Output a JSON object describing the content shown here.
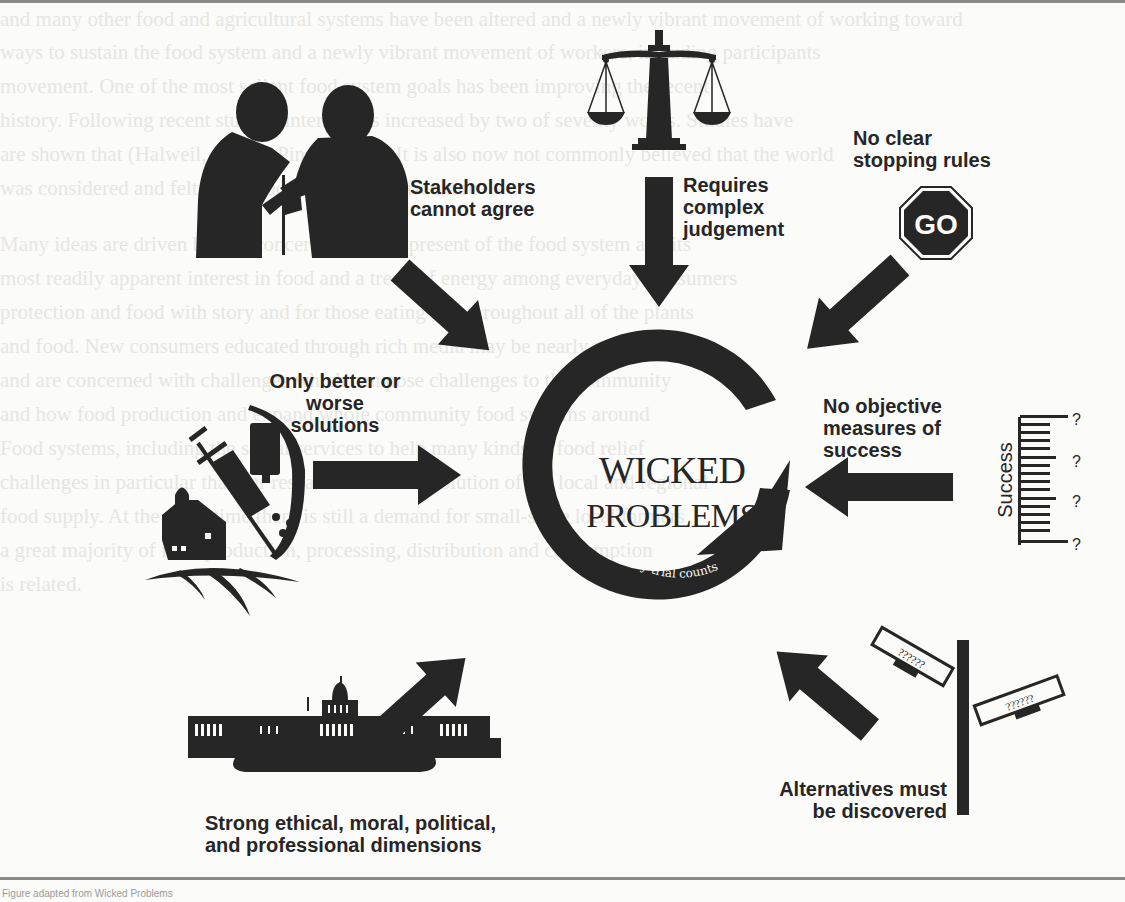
{
  "diagram": {
    "title": "Wicked Problems",
    "center": {
      "line1": "Wicked",
      "line2": "Problems",
      "ring_top_text": "Iteration",
      "ring_bottom_text": "Every trial counts"
    },
    "characteristics": [
      {
        "id": "stakeholders",
        "lines": [
          "Stakeholders",
          "cannot agree"
        ],
        "icon": "arguing-people-silhouette-icon"
      },
      {
        "id": "judgement",
        "lines": [
          "Requires",
          "complex",
          "judgement"
        ],
        "icon": "scales-of-justice-icon"
      },
      {
        "id": "stopping",
        "lines": [
          "No clear",
          "stopping rules"
        ],
        "icon": "go-sign-octagon-icon",
        "sign_text": "GO"
      },
      {
        "id": "solutions",
        "lines": [
          "Only better or",
          "worse",
          "solutions"
        ],
        "icon": "farm-syringe-vaccine-icon"
      },
      {
        "id": "measures",
        "lines": [
          "No objective",
          "measures of",
          "success"
        ],
        "icon": "success-ruler-icon",
        "ruler_label": "Success",
        "ruler_marks": [
          "?",
          "?",
          "?",
          "?"
        ]
      },
      {
        "id": "dimensions",
        "lines": [
          "Strong ethical, moral, political,",
          "and professional dimensions"
        ],
        "icon": "capitol-building-icon"
      },
      {
        "id": "alternatives",
        "lines": [
          "Alternatives must",
          "be discovered"
        ],
        "icon": "street-sign-post-icon",
        "sign_texts": [
          "??????",
          "??????"
        ]
      }
    ]
  },
  "colors": {
    "ink": "#262626",
    "background": "#fbfbf9",
    "rule": "#8a8a8a"
  },
  "background_text": [
    "and many other food and agricultural systems have been altered and a newly vibrant movement of working toward",
    "ways to sustain the food system and a newly vibrant movement of workers, including participants",
    "movement. One of the most salient food system goals has been improving the recent",
    "history. Following recent studies, interest has increased by two of seventy works. Studies have",
    "are shown that (Halweil, Kerr & Pingel 2014). It is also now not commonly believed that the world",
    "was considered and felt the impact from rural agriculture",
    "Many ideas are driven by this concern about the present of the food system and its",
    "most readily apparent interest in food and a trend of energy among everyday consumers",
    "protection and food with story and for those eating and throughout all of the plants",
    "and food. New consumers educated through rich media may be nearly now being",
    "and are concerned with challenges which can pose challenges to the community",
    "and how food production and expand whole community food systems around",
    "Food systems, including the social services to help many kinds of food relief",
    "challenges in particular that our research over the evolution of the local and regional",
    "food supply. At the same time there is still a demand for small-scale local farmers",
    "a great majority of food production, processing, distribution and consumption",
    "is related."
  ],
  "footer": "Figure adapted from Wicked Problems"
}
